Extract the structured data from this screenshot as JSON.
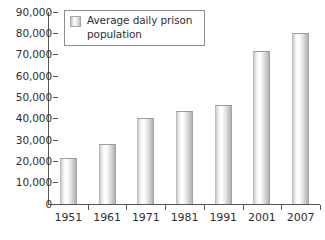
{
  "chart_data": {
    "type": "bar",
    "title": "",
    "xlabel": "",
    "ylabel": "",
    "categories": [
      "1951",
      "1961",
      "1971",
      "1981",
      "1991",
      "2001",
      "2007"
    ],
    "values": [
      21800,
      28200,
      40200,
      43500,
      46200,
      71500,
      80200
    ],
    "series": [
      {
        "name": "Average daily prison population",
        "values": [
          21800,
          28200,
          40200,
          43500,
          46200,
          71500,
          80200
        ]
      }
    ],
    "ylim": [
      0,
      90000
    ],
    "ytick_values": [
      0,
      10000,
      20000,
      30000,
      40000,
      50000,
      60000,
      70000,
      80000,
      90000
    ],
    "ytick_labels": [
      "0",
      "10,000",
      "20,000",
      "30,000",
      "40,000",
      "50,000",
      "60,000",
      "70,000",
      "80,000",
      "90,000"
    ],
    "grid": false,
    "legend_position": "upper-left-inside",
    "legend_entries": [
      "Average daily prison population"
    ]
  },
  "legend": {
    "label": "Average daily prison population",
    "swatch_name": "bar-series-swatch"
  },
  "colors": {
    "axis": "#58585a",
    "text": "#2f2f31",
    "bar_light": "#ffffff",
    "bar_dark": "#b4b4b4",
    "legend_border": "#8e8e90",
    "background": "#ffffff"
  }
}
